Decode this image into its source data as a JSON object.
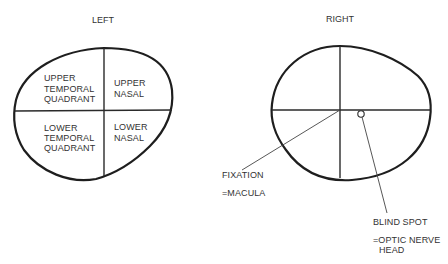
{
  "left_field": {
    "title": "LEFT",
    "quadrants": {
      "upper_temporal": [
        "UPPER",
        "TEMPORAL",
        "QUADRANT"
      ],
      "upper_nasal": [
        "UPPER",
        "NASAL"
      ],
      "lower_temporal": [
        "LOWER",
        "TEMPORAL",
        "QUADRANT"
      ],
      "lower_nasal": [
        "LOWER",
        "NASAL"
      ]
    }
  },
  "right_field": {
    "title": "RIGHT",
    "annotations": {
      "fixation": [
        "FIXATION",
        "=MACULA"
      ],
      "blind_spot": [
        "BLIND SPOT",
        "=OPTIC NERVE",
        "HEAD"
      ]
    }
  }
}
